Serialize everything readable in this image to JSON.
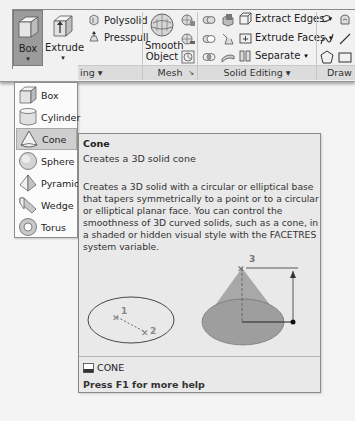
{
  "ribbon": {
    "modeling": {
      "box_label": "Box",
      "extrude_label": "Extrude",
      "polysolid_label": "Polysolid",
      "presspull_label": "Presspull",
      "panel_label": "ing ▾"
    },
    "mesh": {
      "smooth_object_line1": "Smooth",
      "smooth_object_line2": "Object",
      "panel_label": "Mesh",
      "launcher": "↘"
    },
    "solid_editing": {
      "extract_edges_label": "Extract Edges",
      "extrude_faces_label": "Extrude Faces",
      "separate_label": "Separate",
      "dropdown_arrow": "▾",
      "panel_label": "Solid Editing ▾"
    },
    "draw": {
      "panel_label": "Draw"
    }
  },
  "dropdown": {
    "items": [
      {
        "label": "Box",
        "icon": "box-icon"
      },
      {
        "label": "Cylinder",
        "icon": "cylinder-icon"
      },
      {
        "label": "Cone",
        "icon": "cone-icon",
        "hover": true
      },
      {
        "label": "Sphere",
        "icon": "sphere-icon"
      },
      {
        "label": "Pyramid",
        "icon": "pyramid-icon"
      },
      {
        "label": "Wedge",
        "icon": "wedge-icon"
      },
      {
        "label": "Torus",
        "icon": "torus-icon"
      }
    ]
  },
  "tooltip": {
    "title": "Cone",
    "subtitle": "Creates a 3D solid cone",
    "description": "Creates a 3D solid with a circular or elliptical base that tapers symmetrically to a point or to a circular or elliptical planar face. You can control the smoothness of 3D curved solids, such as a cone, in a shaded or hidden visual style with the FACETRES system variable.",
    "diagram": {
      "point1": "1",
      "point2": "2",
      "point3": "3"
    },
    "command": "CONE",
    "help": "Press F1 for more help"
  },
  "colors": {
    "ribbon_bg": "#f1f1f1",
    "panel_bar": "#dcdcdc",
    "active_button": "#9b9b9b",
    "tooltip_bg": "#e9e9e9",
    "cone_fill": "#a9a9a9"
  }
}
